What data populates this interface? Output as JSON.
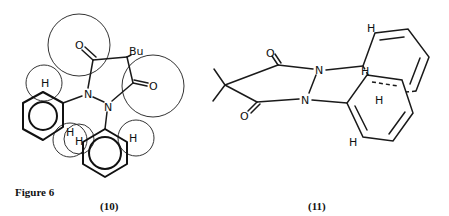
{
  "figure": {
    "title": "Figure 6",
    "compounds": [
      {
        "label": "(10)",
        "atoms": {
          "oxygen_top": "O",
          "oxygen_right": "O",
          "substituent": "Bu",
          "nitrogen_1": "N",
          "nitrogen_2": "N",
          "hydrogen_top_left": "H",
          "hydrogen_mid_1": "H",
          "hydrogen_mid_2": "H",
          "hydrogen_right": "H"
        }
      },
      {
        "label": "(11)",
        "atoms": {
          "oxygen_top": "O",
          "oxygen_bottom": "O",
          "nitrogen_1": "N",
          "nitrogen_2": "N",
          "hydrogen_top": "H",
          "hydrogen_mid_1": "H",
          "hydrogen_mid_2": "H",
          "hydrogen_bottom": "H"
        }
      }
    ]
  }
}
